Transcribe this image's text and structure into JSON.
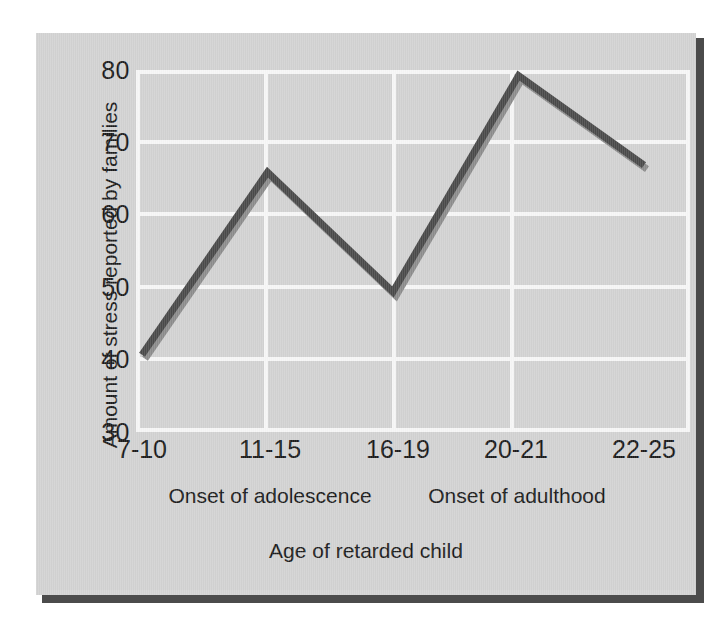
{
  "chart_data": {
    "type": "line",
    "title": "",
    "subtitle": "",
    "xlabel": "Age of retarded child",
    "ylabel": "Amount of stress reported by families",
    "categories": [
      "7-10",
      "11-15",
      "16-19",
      "20-21",
      "22-25"
    ],
    "values": [
      40.5,
      66,
      49.3,
      79.5,
      67
    ],
    "series": [
      {
        "name": "Amount of stress reported by families",
        "values": [
          40.5,
          66,
          49.3,
          79.5,
          67
        ]
      }
    ],
    "ylim": [
      30,
      80
    ],
    "yticks": [
      80,
      70,
      60,
      50,
      40,
      30
    ],
    "ytick_labels": [
      "80",
      "70",
      "60",
      "50",
      "40",
      "30"
    ],
    "grid": true,
    "legend": false,
    "legend_position": "none",
    "annotations": [
      {
        "text": "Onset of adolescence",
        "near_category": "11-15"
      },
      {
        "text": "Onset of adulthood",
        "near_category": "20-21"
      }
    ],
    "colors": {
      "line": "#4a4a4a",
      "line_highlight": "#8c8c8c",
      "plot_background": "#d2d2d2",
      "grid": "#f6f6f6",
      "card_background": "#d2d2d2",
      "shadow": "#4b4b4b",
      "text": "#1b1b1b"
    }
  },
  "axes": {
    "y_title": "Amount of stress reported by families",
    "x_title": "Age of retarded child",
    "y_ticks": [
      "80",
      "70",
      "60",
      "50",
      "40",
      "30"
    ],
    "x_ticks": [
      "7-10",
      "11-15",
      "16-19",
      "20-21",
      "22-25"
    ]
  },
  "captions": {
    "adolescence": "Onset of adolescence",
    "adulthood": "Onset of adulthood"
  }
}
